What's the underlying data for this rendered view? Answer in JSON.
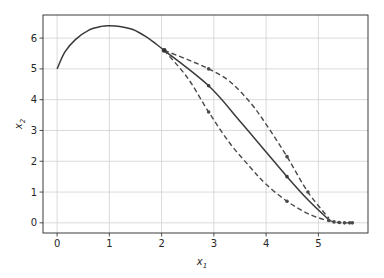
{
  "chart_data": {
    "type": "line",
    "title": "",
    "xlabel": "x1",
    "ylabel": "x2",
    "xlim": [
      -0.27,
      5.95
    ],
    "ylim": [
      -0.33,
      6.75
    ],
    "grid": true,
    "legend": null,
    "x_ticks": [
      0,
      1,
      2,
      3,
      4,
      5
    ],
    "y_ticks": [
      0,
      1,
      2,
      3,
      4,
      5,
      6
    ],
    "series": [
      {
        "name": "nominal-trajectory",
        "style": "solid",
        "color": "#3a3a3a",
        "points": [
          [
            0.0,
            5.0
          ],
          [
            0.15,
            5.55
          ],
          [
            0.35,
            5.95
          ],
          [
            0.6,
            6.25
          ],
          [
            0.85,
            6.38
          ],
          [
            1.0,
            6.4
          ],
          [
            1.2,
            6.38
          ],
          [
            1.45,
            6.28
          ],
          [
            1.7,
            6.05
          ],
          [
            1.9,
            5.8
          ],
          [
            2.05,
            5.6
          ]
        ]
      },
      {
        "name": "middle-branch",
        "style": "solid",
        "color": "#3a3a3a",
        "points": [
          [
            2.05,
            5.6
          ],
          [
            2.9,
            4.45
          ],
          [
            3.5,
            3.3
          ],
          [
            4.0,
            2.3
          ],
          [
            4.4,
            1.5
          ],
          [
            4.8,
            0.75
          ],
          [
            5.2,
            0.1
          ]
        ],
        "markers": [
          [
            2.9,
            4.45
          ],
          [
            4.4,
            1.5
          ]
        ]
      },
      {
        "name": "upper-branch",
        "style": "dashed",
        "color": "#4a4a4a",
        "points": [
          [
            2.05,
            5.6
          ],
          [
            2.5,
            5.3
          ],
          [
            2.9,
            5.0
          ],
          [
            3.3,
            4.6
          ],
          [
            3.7,
            3.9
          ],
          [
            4.0,
            3.2
          ],
          [
            4.4,
            2.15
          ],
          [
            4.8,
            1.0
          ],
          [
            5.2,
            0.15
          ]
        ],
        "markers": [
          [
            2.9,
            5.0
          ],
          [
            4.4,
            2.15
          ],
          [
            4.8,
            1.0
          ]
        ]
      },
      {
        "name": "lower-branch",
        "style": "dashed",
        "color": "#4a4a4a",
        "points": [
          [
            2.05,
            5.6
          ],
          [
            2.5,
            4.7
          ],
          [
            2.9,
            3.6
          ],
          [
            3.3,
            2.6
          ],
          [
            3.7,
            1.8
          ],
          [
            4.0,
            1.25
          ],
          [
            4.4,
            0.7
          ],
          [
            4.8,
            0.3
          ],
          [
            5.2,
            0.05
          ]
        ],
        "markers": [
          [
            2.9,
            3.6
          ],
          [
            4.4,
            0.7
          ]
        ]
      },
      {
        "name": "terminal-tail",
        "style": "dashed",
        "color": "#4a4a4a",
        "points": [
          [
            5.2,
            0.08
          ],
          [
            5.3,
            0.03
          ],
          [
            5.4,
            0.01
          ],
          [
            5.5,
            0.0
          ],
          [
            5.65,
            0.0
          ]
        ],
        "markers": [
          [
            5.2,
            0.08
          ],
          [
            5.3,
            0.03
          ],
          [
            5.4,
            0.01
          ],
          [
            5.5,
            0.0
          ],
          [
            5.6,
            0.0
          ],
          [
            5.65,
            0.0
          ]
        ]
      }
    ],
    "branch_point": [
      2.05,
      5.6
    ]
  },
  "labels": {
    "xlabel_main": "x",
    "xlabel_sub": "1",
    "ylabel_main": "x",
    "ylabel_sub": "2"
  }
}
